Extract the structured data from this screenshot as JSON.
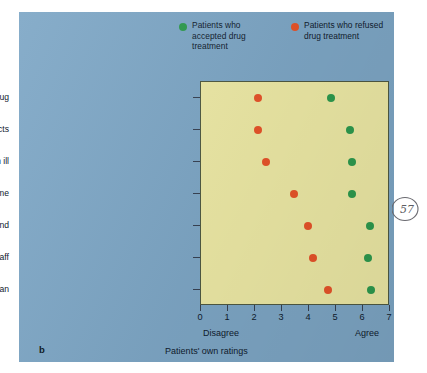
{
  "panel": {
    "letter": "b"
  },
  "legend": {
    "entries": [
      {
        "label": "Patients who accepted drug treatment",
        "color": "#2e9b4e",
        "icon": "green-dot-icon"
      },
      {
        "label": "Patients who refused drug treatment",
        "color": "#e8542a",
        "icon": "orange-dot-icon"
      }
    ]
  },
  "annotation": {
    "page_mark": "57"
  },
  "chart_data": {
    "type": "scatter",
    "title": "",
    "xlabel": "Patients' own ratings",
    "ylabel": "",
    "xlim": [
      0,
      7
    ],
    "xticks": [
      "0",
      "1",
      "2",
      "3",
      "4",
      "5",
      "6",
      "7"
    ],
    "x_end_labels": {
      "low": "Disagree",
      "high": "Agree"
    },
    "grid": false,
    "legend_position": "top",
    "orientation": "horizontal",
    "categories": [
      "Physician explained reason for drug",
      "Physician explained drug's side effects",
      "Believe I'm ill",
      "Physician understands me",
      "Physician has my best interests in mind",
      "Satisfied with ward staff",
      "Satisfied with physician"
    ],
    "series": [
      {
        "name": "Patients who accepted drug treatment",
        "color": "#2e9b4e",
        "values": [
          4.8,
          5.5,
          5.6,
          5.6,
          6.25,
          6.2,
          6.3
        ]
      },
      {
        "name": "Patients who refused drug treatment",
        "color": "#e8542a",
        "values": [
          2.1,
          2.1,
          2.4,
          3.45,
          3.95,
          4.15,
          4.7
        ]
      }
    ]
  }
}
